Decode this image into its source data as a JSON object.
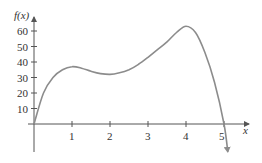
{
  "chart_data": {
    "type": "line",
    "title": "",
    "xlabel": "x",
    "ylabel": "f(x)",
    "xlim": [
      0,
      5.5
    ],
    "ylim": [
      0,
      65
    ],
    "grid": false,
    "legend": null,
    "x_ticks": [
      1,
      2,
      3,
      4,
      5
    ],
    "x_tick_labels": [
      "1",
      "2",
      "3",
      "4",
      "5"
    ],
    "y_ticks": [
      10,
      20,
      30,
      40,
      50,
      60
    ],
    "y_tick_labels": [
      "10",
      "20",
      "30",
      "40",
      "50",
      "60"
    ],
    "series": [
      {
        "name": "f(x)",
        "x": [
          0,
          0.25,
          0.5,
          0.75,
          1.0,
          1.25,
          1.5,
          1.75,
          2.0,
          2.25,
          2.5,
          2.75,
          3.0,
          3.25,
          3.5,
          3.75,
          4.0,
          4.25,
          4.5,
          4.75,
          5.0,
          5.1
        ],
        "values": [
          0,
          20,
          30,
          35,
          37,
          36,
          34,
          32.5,
          32,
          33,
          35,
          38.5,
          43,
          48,
          53,
          59,
          63,
          59,
          46,
          27,
          0,
          -18
        ],
        "end_arrow": true,
        "color": "#8c8c8c"
      }
    ],
    "annotations": []
  },
  "colors": {
    "axis": "#555555",
    "curve": "#8c8c8c",
    "text": "#333333",
    "background": "#ffffff"
  }
}
